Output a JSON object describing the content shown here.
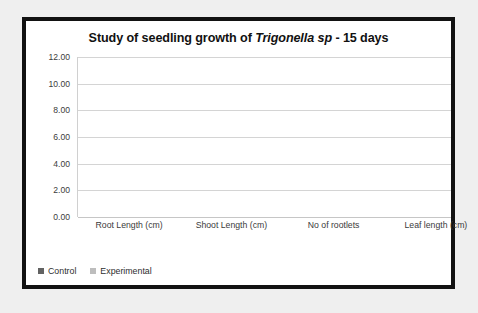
{
  "chart_data": {
    "type": "bar",
    "title": "Study of seedling growth of Trigonella sp - 15 days",
    "title_parts": {
      "before": "Study of seedling growth of ",
      "italic": "Trigonella sp",
      "after": " - 15 days"
    },
    "categories": [
      "Root Length (cm)",
      "Shoot Length (cm)",
      "No of rootlets",
      "Leaf length (cm)"
    ],
    "series": [
      {
        "name": "Control",
        "color": "#626262",
        "values": [
          5.4,
          6.6,
          6.9,
          1.0
        ]
      },
      {
        "name": "Experimental",
        "color": "#bdbdbd",
        "values": [
          5.9,
          7.5,
          9.9,
          1.2
        ]
      }
    ],
    "xlabel": "",
    "ylabel": "",
    "ylim": [
      0,
      12
    ],
    "ytick_step": 2,
    "yticks": [
      "12.00",
      "10.00",
      "8.00",
      "6.00",
      "4.00",
      "2.00",
      "0.00"
    ],
    "ytick_values": [
      12,
      10,
      8,
      6,
      4,
      2,
      0
    ],
    "grid": true,
    "legend_position": "bottom-left"
  },
  "style": {
    "frame_color": "#121212",
    "plot_background": "#ffffff",
    "page_background": "#efefef",
    "gridline_color": "#d4d4d4",
    "text_color": "#3b3b3b"
  }
}
